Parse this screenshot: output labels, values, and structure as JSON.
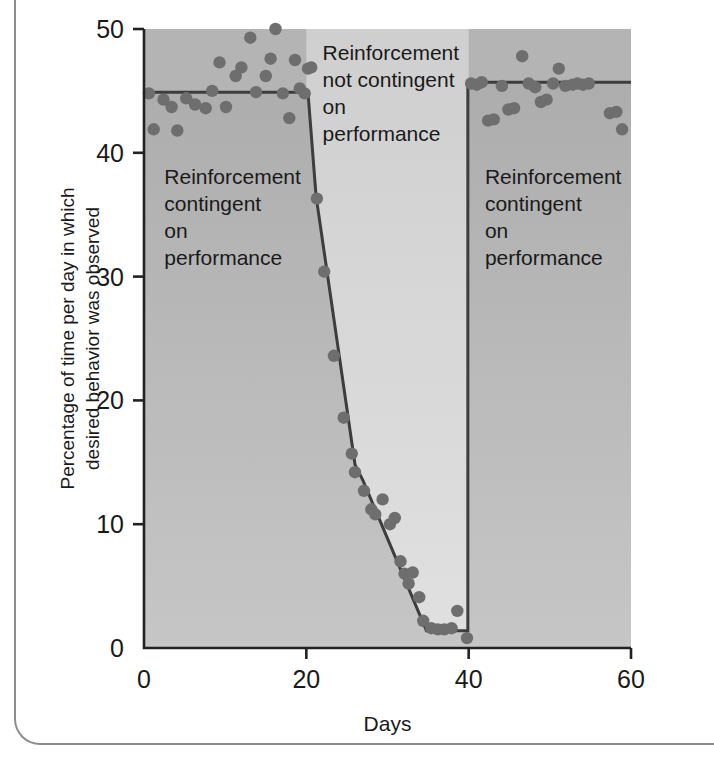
{
  "chart_data": {
    "type": "scatter",
    "title": "",
    "xlabel": "Days",
    "ylabel": "Percentage of time per day in which desired behavior was observed",
    "ylabel_line1": "Percentage of time per day in which",
    "ylabel_line2": "desired behavior was observed",
    "xlim": [
      0,
      60
    ],
    "ylim": [
      0,
      50
    ],
    "xticks": [
      0,
      20,
      40,
      60
    ],
    "xtick_labels": [
      "0",
      "20",
      "40",
      "60"
    ],
    "yticks": [
      0,
      10,
      20,
      30,
      40,
      50
    ],
    "ytick_labels": [
      "0",
      "10",
      "20",
      "30",
      "40",
      "50"
    ],
    "grid": false,
    "legend": "none",
    "point_color": "#6e6e6e",
    "line_color": "#3d3d3d",
    "band_dark_color": "#b0b0b0",
    "band_light_color": "#d4d4d4",
    "band_mid_color": "#c4c4c4",
    "series": [
      {
        "name": "Percentage of time desired behavior observed",
        "points": [
          [
            0.6,
            44.8
          ],
          [
            1.2,
            41.9
          ],
          [
            2.4,
            44.3
          ],
          [
            3.4,
            43.7
          ],
          [
            4.1,
            41.8
          ],
          [
            5.2,
            44.4
          ],
          [
            6.3,
            43.9
          ],
          [
            7.6,
            43.6
          ],
          [
            8.4,
            45.0
          ],
          [
            9.3,
            47.3
          ],
          [
            10.1,
            43.7
          ],
          [
            11.3,
            46.2
          ],
          [
            12.0,
            46.9
          ],
          [
            13.1,
            49.3
          ],
          [
            13.8,
            44.9
          ],
          [
            15.0,
            46.2
          ],
          [
            15.6,
            47.6
          ],
          [
            16.2,
            50.0
          ],
          [
            17.1,
            44.8
          ],
          [
            17.9,
            42.8
          ],
          [
            18.6,
            47.5
          ],
          [
            19.2,
            45.2
          ],
          [
            19.8,
            44.8
          ],
          [
            20.2,
            46.8
          ],
          [
            20.6,
            46.9
          ],
          [
            21.3,
            36.3
          ],
          [
            22.2,
            30.4
          ],
          [
            23.4,
            23.6
          ],
          [
            24.6,
            18.6
          ],
          [
            25.6,
            15.7
          ],
          [
            26.0,
            14.2
          ],
          [
            27.1,
            12.7
          ],
          [
            28.0,
            11.2
          ],
          [
            28.5,
            10.8
          ],
          [
            29.4,
            12.0
          ],
          [
            30.3,
            10.0
          ],
          [
            30.9,
            10.5
          ],
          [
            31.6,
            7.0
          ],
          [
            32.1,
            6.0
          ],
          [
            32.6,
            5.2
          ],
          [
            33.1,
            6.1
          ],
          [
            33.9,
            4.1
          ],
          [
            34.4,
            2.2
          ],
          [
            35.4,
            1.6
          ],
          [
            36.2,
            1.5
          ],
          [
            37.0,
            1.5
          ],
          [
            37.9,
            1.6
          ],
          [
            38.6,
            3.0
          ],
          [
            39.8,
            0.8
          ],
          [
            40.3,
            45.6
          ],
          [
            41.0,
            45.5
          ],
          [
            41.6,
            45.7
          ],
          [
            42.4,
            42.6
          ],
          [
            43.1,
            42.7
          ],
          [
            44.1,
            45.4
          ],
          [
            44.9,
            43.5
          ],
          [
            45.6,
            43.6
          ],
          [
            46.6,
            47.8
          ],
          [
            47.4,
            45.6
          ],
          [
            48.2,
            45.3
          ],
          [
            48.9,
            44.1
          ],
          [
            49.6,
            44.3
          ],
          [
            50.4,
            45.6
          ],
          [
            51.1,
            46.8
          ],
          [
            51.9,
            45.4
          ],
          [
            52.8,
            45.5
          ],
          [
            53.4,
            45.6
          ],
          [
            54.1,
            45.5
          ],
          [
            54.8,
            45.6
          ],
          [
            57.4,
            43.2
          ],
          [
            58.2,
            43.3
          ],
          [
            58.9,
            41.9
          ]
        ]
      }
    ],
    "trend_line": [
      [
        0,
        44.9
      ],
      [
        19.5,
        44.9
      ],
      [
        20.2,
        44.9
      ],
      [
        21.2,
        36.5
      ],
      [
        26.0,
        14.8
      ],
      [
        27.0,
        13.5
      ],
      [
        34.8,
        1.4
      ],
      [
        39.9,
        1.4
      ],
      [
        39.9,
        45.7
      ],
      [
        60,
        45.7
      ]
    ],
    "annotations": [
      {
        "id": "phase-1",
        "lines": [
          "Reinforcement",
          "contingent",
          "on",
          "performance"
        ],
        "x_days": 2.5,
        "y_pct": 37.5
      },
      {
        "id": "phase-2",
        "lines": [
          "Reinforcement",
          "not contingent",
          "on",
          "performance"
        ],
        "x_days": 22.0,
        "y_pct": 47.5
      },
      {
        "id": "phase-3",
        "lines": [
          "Reinforcement",
          "contingent",
          "on",
          "performance"
        ],
        "x_days": 42.0,
        "y_pct": 37.5
      }
    ],
    "phase_boundaries": [
      20,
      40
    ]
  }
}
